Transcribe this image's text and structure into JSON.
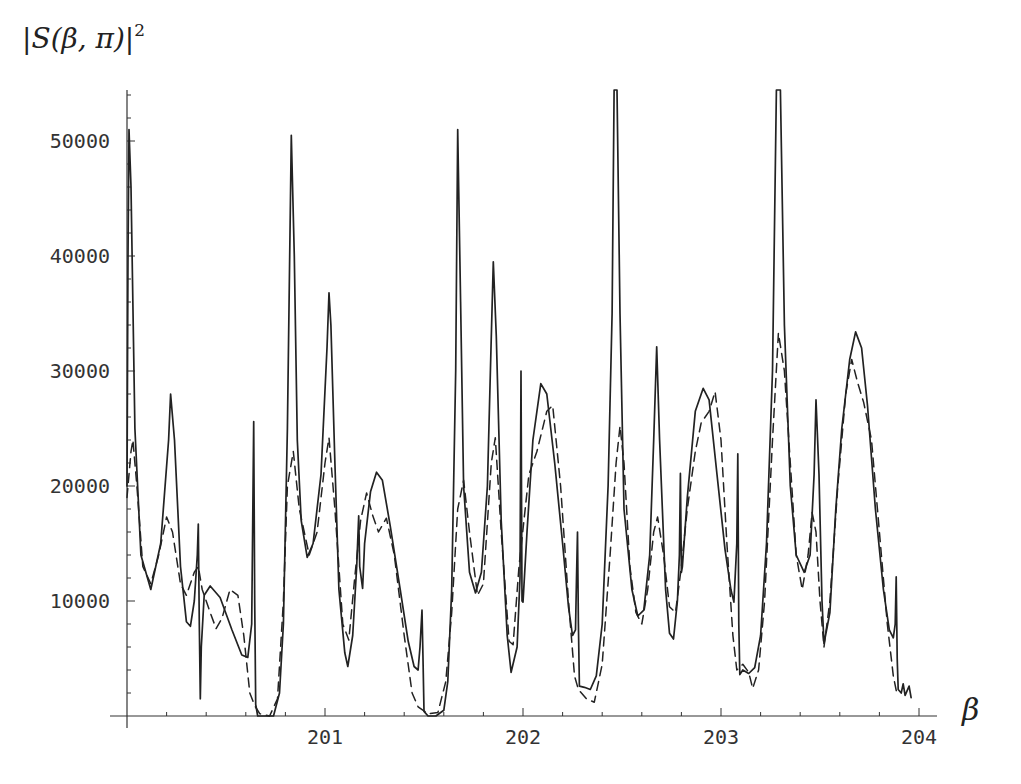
{
  "chart_data": {
    "type": "line",
    "title": "",
    "ylabel": "|S(β,π)|²",
    "xlabel": "β",
    "xlim": [
      200.0,
      204.1
    ],
    "ylim": [
      0,
      54500
    ],
    "grid": false,
    "legend": null,
    "x_ticks": [
      201,
      202,
      203,
      204
    ],
    "x_tick_labels": [
      "201",
      "202",
      "203",
      "204"
    ],
    "x_minor_step": 0.2,
    "y_ticks": [
      10000,
      20000,
      30000,
      40000,
      50000
    ],
    "y_tick_labels": [
      "10000",
      "20000",
      "30000",
      "40000",
      "50000"
    ],
    "y_minor_step": 2000,
    "series": [
      {
        "name": "solid",
        "style": "solid",
        "points": [
          [
            200.0,
            20000
          ],
          [
            200.005,
            40000
          ],
          [
            200.01,
            51000
          ],
          [
            200.02,
            46000
          ],
          [
            200.04,
            25000
          ],
          [
            200.07,
            14000
          ],
          [
            200.12,
            11000
          ],
          [
            200.17,
            15000
          ],
          [
            200.21,
            24000
          ],
          [
            200.22,
            28000
          ],
          [
            200.24,
            24000
          ],
          [
            200.27,
            13000
          ],
          [
            200.3,
            8200
          ],
          [
            200.32,
            7800
          ],
          [
            200.34,
            10000
          ],
          [
            200.355,
            14000
          ],
          [
            200.36,
            16700
          ],
          [
            200.365,
            8000
          ],
          [
            200.37,
            1500
          ],
          [
            200.375,
            6000
          ],
          [
            200.39,
            10500
          ],
          [
            200.42,
            11300
          ],
          [
            200.47,
            10300
          ],
          [
            200.53,
            7500
          ],
          [
            200.58,
            5300
          ],
          [
            200.61,
            5100
          ],
          [
            200.63,
            8000
          ],
          [
            200.64,
            25600
          ],
          [
            200.645,
            10000
          ],
          [
            200.65,
            1000
          ],
          [
            200.66,
            0
          ],
          [
            200.7,
            0
          ],
          [
            200.74,
            0
          ],
          [
            200.77,
            2000
          ],
          [
            200.79,
            8000
          ],
          [
            200.81,
            25000
          ],
          [
            200.83,
            50500
          ],
          [
            200.845,
            40000
          ],
          [
            200.86,
            24000
          ],
          [
            200.88,
            17000
          ],
          [
            200.91,
            13800
          ],
          [
            200.94,
            15000
          ],
          [
            200.98,
            21000
          ],
          [
            201.01,
            32000
          ],
          [
            201.02,
            36800
          ],
          [
            201.03,
            34000
          ],
          [
            201.05,
            22000
          ],
          [
            201.07,
            11000
          ],
          [
            201.1,
            5500
          ],
          [
            201.115,
            4300
          ],
          [
            201.14,
            7000
          ],
          [
            201.16,
            13000
          ],
          [
            201.17,
            17400
          ],
          [
            201.175,
            13000
          ],
          [
            201.19,
            11100
          ],
          [
            201.2,
            15000
          ],
          [
            201.23,
            19500
          ],
          [
            201.26,
            21200
          ],
          [
            201.29,
            20500
          ],
          [
            201.33,
            16500
          ],
          [
            201.38,
            11000
          ],
          [
            201.42,
            6500
          ],
          [
            201.45,
            4300
          ],
          [
            201.47,
            4000
          ],
          [
            201.48,
            6000
          ],
          [
            201.49,
            9200
          ],
          [
            201.495,
            5000
          ],
          [
            201.5,
            400
          ],
          [
            201.52,
            0
          ],
          [
            201.56,
            0
          ],
          [
            201.6,
            500
          ],
          [
            201.62,
            3000
          ],
          [
            201.64,
            11000
          ],
          [
            201.66,
            30000
          ],
          [
            201.67,
            51000
          ],
          [
            201.685,
            36000
          ],
          [
            201.7,
            20000
          ],
          [
            201.73,
            12500
          ],
          [
            201.76,
            10700
          ],
          [
            201.79,
            12500
          ],
          [
            201.82,
            20000
          ],
          [
            201.84,
            33000
          ],
          [
            201.85,
            39500
          ],
          [
            201.865,
            33000
          ],
          [
            201.89,
            17000
          ],
          [
            201.92,
            7000
          ],
          [
            201.94,
            3800
          ],
          [
            201.97,
            6000
          ],
          [
            201.985,
            12000
          ],
          [
            201.99,
            30000
          ],
          [
            201.995,
            10000
          ],
          [
            202.0,
            9900
          ],
          [
            202.02,
            16000
          ],
          [
            202.05,
            24000
          ],
          [
            202.09,
            28900
          ],
          [
            202.12,
            28000
          ],
          [
            202.16,
            22000
          ],
          [
            202.2,
            15000
          ],
          [
            202.23,
            9500
          ],
          [
            202.25,
            7000
          ],
          [
            202.265,
            7500
          ],
          [
            202.27,
            12000
          ],
          [
            202.275,
            16000
          ],
          [
            202.28,
            8000
          ],
          [
            202.285,
            2600
          ],
          [
            202.31,
            2500
          ],
          [
            202.34,
            2300
          ],
          [
            202.37,
            3500
          ],
          [
            202.4,
            8000
          ],
          [
            202.43,
            20000
          ],
          [
            202.45,
            35000
          ],
          [
            202.46,
            54500
          ],
          [
            202.475,
            54500
          ],
          [
            202.49,
            35000
          ],
          [
            202.51,
            18000
          ],
          [
            202.55,
            11000
          ],
          [
            202.58,
            8700
          ],
          [
            202.61,
            9200
          ],
          [
            202.64,
            14000
          ],
          [
            202.66,
            24000
          ],
          [
            202.675,
            32100
          ],
          [
            202.69,
            24000
          ],
          [
            202.72,
            11000
          ],
          [
            202.74,
            7200
          ],
          [
            202.76,
            6700
          ],
          [
            202.78,
            10000
          ],
          [
            202.79,
            14000
          ],
          [
            202.795,
            21100
          ],
          [
            202.8,
            12500
          ],
          [
            202.805,
            13000
          ],
          [
            202.83,
            19000
          ],
          [
            202.87,
            26500
          ],
          [
            202.91,
            28500
          ],
          [
            202.94,
            27500
          ],
          [
            202.98,
            21000
          ],
          [
            203.02,
            14500
          ],
          [
            203.05,
            11000
          ],
          [
            203.065,
            9900
          ],
          [
            203.08,
            15000
          ],
          [
            203.085,
            22800
          ],
          [
            203.09,
            8000
          ],
          [
            203.095,
            3600
          ],
          [
            203.11,
            4000
          ],
          [
            203.14,
            3700
          ],
          [
            203.17,
            4200
          ],
          [
            203.2,
            7000
          ],
          [
            203.23,
            15000
          ],
          [
            203.26,
            30000
          ],
          [
            203.28,
            54500
          ],
          [
            203.3,
            54500
          ],
          [
            203.32,
            34000
          ],
          [
            203.35,
            20000
          ],
          [
            203.38,
            14000
          ],
          [
            203.42,
            12500
          ],
          [
            203.45,
            14000
          ],
          [
            203.47,
            21000
          ],
          [
            203.48,
            27500
          ],
          [
            203.495,
            21000
          ],
          [
            203.51,
            10000
          ],
          [
            203.52,
            6300
          ],
          [
            203.55,
            9000
          ],
          [
            203.58,
            18000
          ],
          [
            203.61,
            25000
          ],
          [
            203.65,
            31000
          ],
          [
            203.68,
            33400
          ],
          [
            203.71,
            32000
          ],
          [
            203.74,
            27000
          ],
          [
            203.78,
            18000
          ],
          [
            203.82,
            11000
          ],
          [
            203.85,
            7500
          ],
          [
            203.87,
            6800
          ],
          [
            203.88,
            8000
          ],
          [
            203.885,
            12100
          ],
          [
            203.89,
            5000
          ],
          [
            203.895,
            2300
          ],
          [
            203.91,
            2000
          ],
          [
            203.92,
            2800
          ],
          [
            203.93,
            1800
          ],
          [
            203.95,
            2600
          ],
          [
            203.96,
            1600
          ]
        ]
      },
      {
        "name": "dashed",
        "style": "dashed",
        "points": [
          [
            200.0,
            19000
          ],
          [
            200.02,
            23000
          ],
          [
            200.03,
            24000
          ],
          [
            200.05,
            20000
          ],
          [
            200.08,
            13000
          ],
          [
            200.12,
            11500
          ],
          [
            200.16,
            14000
          ],
          [
            200.2,
            17300
          ],
          [
            200.23,
            16000
          ],
          [
            200.27,
            11500
          ],
          [
            200.3,
            10500
          ],
          [
            200.34,
            12500
          ],
          [
            200.36,
            13000
          ],
          [
            200.38,
            11000
          ],
          [
            200.42,
            9000
          ],
          [
            200.45,
            7600
          ],
          [
            200.48,
            8500
          ],
          [
            200.52,
            11000
          ],
          [
            200.56,
            10500
          ],
          [
            200.59,
            7000
          ],
          [
            200.62,
            2000
          ],
          [
            200.645,
            900
          ],
          [
            200.67,
            200
          ],
          [
            200.72,
            0
          ],
          [
            200.76,
            1500
          ],
          [
            200.79,
            10000
          ],
          [
            200.81,
            20000
          ],
          [
            200.84,
            23000
          ],
          [
            200.87,
            18000
          ],
          [
            200.92,
            14000
          ],
          [
            200.96,
            16000
          ],
          [
            201.0,
            22000
          ],
          [
            201.02,
            24200
          ],
          [
            201.05,
            18000
          ],
          [
            201.09,
            8000
          ],
          [
            201.12,
            6600
          ],
          [
            201.15,
            12000
          ],
          [
            201.18,
            17000
          ],
          [
            201.21,
            19400
          ],
          [
            201.24,
            17500
          ],
          [
            201.27,
            16000
          ],
          [
            201.31,
            17200
          ],
          [
            201.35,
            14000
          ],
          [
            201.4,
            7000
          ],
          [
            201.44,
            2000
          ],
          [
            201.47,
            800
          ],
          [
            201.52,
            200
          ],
          [
            201.57,
            300
          ],
          [
            201.61,
            3000
          ],
          [
            201.64,
            9000
          ],
          [
            201.67,
            18000
          ],
          [
            201.7,
            20500
          ],
          [
            201.73,
            16000
          ],
          [
            201.77,
            10500
          ],
          [
            201.8,
            11500
          ],
          [
            201.84,
            22000
          ],
          [
            201.86,
            24200
          ],
          [
            201.89,
            16000
          ],
          [
            201.93,
            6500
          ],
          [
            201.95,
            6200
          ],
          [
            201.98,
            13000
          ],
          [
            202.03,
            21000
          ],
          [
            202.07,
            23000
          ],
          [
            202.12,
            26500
          ],
          [
            202.15,
            27000
          ],
          [
            202.19,
            20000
          ],
          [
            202.23,
            10000
          ],
          [
            202.26,
            3500
          ],
          [
            202.28,
            2300
          ],
          [
            202.32,
            1500
          ],
          [
            202.36,
            1200
          ],
          [
            202.4,
            4500
          ],
          [
            202.44,
            14000
          ],
          [
            202.47,
            22000
          ],
          [
            202.49,
            25200
          ],
          [
            202.51,
            22000
          ],
          [
            202.54,
            13000
          ],
          [
            202.57,
            9000
          ],
          [
            202.6,
            8000
          ],
          [
            202.63,
            11000
          ],
          [
            202.66,
            16000
          ],
          [
            202.68,
            17300
          ],
          [
            202.71,
            14000
          ],
          [
            202.74,
            9500
          ],
          [
            202.77,
            9000
          ],
          [
            202.8,
            13000
          ],
          [
            202.83,
            18000
          ],
          [
            202.87,
            23000
          ],
          [
            202.9,
            25500
          ],
          [
            202.94,
            26500
          ],
          [
            202.97,
            28200
          ],
          [
            203.0,
            24000
          ],
          [
            203.03,
            15000
          ],
          [
            203.06,
            7000
          ],
          [
            203.08,
            4000
          ],
          [
            203.11,
            4500
          ],
          [
            203.14,
            3800
          ],
          [
            203.16,
            2400
          ],
          [
            203.19,
            4000
          ],
          [
            203.22,
            10000
          ],
          [
            203.26,
            24000
          ],
          [
            203.29,
            33300
          ],
          [
            203.32,
            30000
          ],
          [
            203.35,
            22000
          ],
          [
            203.38,
            14000
          ],
          [
            203.41,
            11000
          ],
          [
            203.44,
            14000
          ],
          [
            203.46,
            17700
          ],
          [
            203.48,
            16000
          ],
          [
            203.5,
            10000
          ],
          [
            203.52,
            6000
          ],
          [
            203.55,
            10000
          ],
          [
            203.59,
            20000
          ],
          [
            203.63,
            28000
          ],
          [
            203.66,
            31000
          ],
          [
            203.69,
            29000
          ],
          [
            203.72,
            27300
          ],
          [
            203.76,
            24000
          ],
          [
            203.8,
            16000
          ],
          [
            203.84,
            8000
          ],
          [
            203.87,
            3500
          ],
          [
            203.89,
            1800
          ]
        ]
      }
    ]
  },
  "labels": {
    "y_title_open": "|",
    "y_title_S": "S",
    "y_title_args": "(β, π)|",
    "y_title_sup": "2",
    "x_title": "β"
  },
  "colors": {
    "line": "#222222",
    "axis": "#333333",
    "text": "#333333",
    "background": "#ffffff"
  }
}
